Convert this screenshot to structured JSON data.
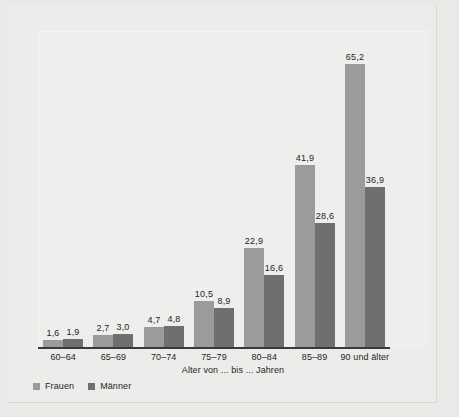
{
  "chart_data": {
    "type": "bar",
    "title": "",
    "subtitle": "",
    "xlabel": "Alter von ... bis ... Jahren",
    "ylabel": "",
    "ylim": [
      0,
      72
    ],
    "grid": false,
    "legend_position": "bottom-left",
    "categories": [
      "60–64",
      "65–69",
      "70–74",
      "75–79",
      "80–84",
      "85–89",
      "90 und älter"
    ],
    "series": [
      {
        "name": "Frauen",
        "color": "#9b9b9b",
        "values": [
          1.6,
          2.7,
          4.7,
          10.5,
          22.9,
          41.9,
          65.2
        ],
        "value_labels": [
          "1,6",
          "2,7",
          "4,7",
          "10,5",
          "22,9",
          "41,9",
          "65,2"
        ]
      },
      {
        "name": "Männer",
        "color": "#6f6f6f",
        "values": [
          1.9,
          3.0,
          4.8,
          8.9,
          16.6,
          28.6,
          36.9
        ],
        "value_labels": [
          "1,9",
          "3,0",
          "4,8",
          "8,9",
          "16,6",
          "28,6",
          "36,9"
        ]
      }
    ]
  },
  "legend": {
    "items": [
      {
        "label": "Frauen",
        "swatch": "frauen-swatch"
      },
      {
        "label": "Männer",
        "swatch": "maenner-swatch"
      }
    ]
  },
  "axis": {
    "x_title": "Alter von ... bis ... Jahren"
  },
  "colors": {
    "series_frauen": "#9b9b9b",
    "series_maenner": "#6f6f6f",
    "axis_line": "#3a3a3a",
    "panel_background": "#eeeeec",
    "page_background": "#e9e9e7",
    "text": "#1f1f1f"
  }
}
